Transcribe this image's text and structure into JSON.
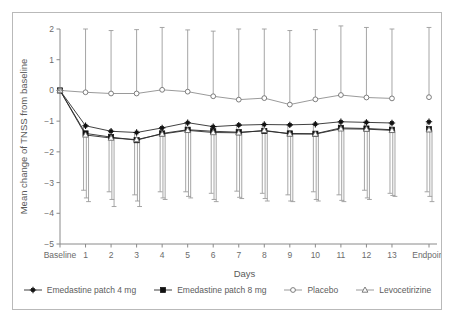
{
  "chart_data": {
    "type": "line",
    "title": "",
    "xlabel": "Days",
    "ylabel": "Mean change of TNSS from baseline",
    "ylim": [
      -5,
      2
    ],
    "yticks": [
      2,
      1,
      0,
      -1,
      -2,
      -3,
      -4,
      -5
    ],
    "ytick_labels": [
      "2",
      "1",
      "0",
      "−1",
      "−2",
      "−3",
      "−4",
      "−5"
    ],
    "grid": false,
    "legend_position": "bottom",
    "categories": [
      "Baseline",
      "1",
      "2",
      "3",
      "4",
      "5",
      "6",
      "7",
      "8",
      "9",
      "10",
      "11",
      "12",
      "13",
      "Endpoint"
    ],
    "gap_before_last": true,
    "series": [
      {
        "name": "Emedastine patch 4 mg",
        "marker": "cross-diamond",
        "marker_fill": "filled",
        "values": [
          0.0,
          -1.15,
          -1.33,
          -1.37,
          -1.22,
          -1.05,
          -1.18,
          -1.13,
          -1.11,
          -1.12,
          -1.1,
          -1.02,
          -1.04,
          -1.06,
          -1.02
        ],
        "err_low": [
          0.0,
          -3.25,
          -3.3,
          -3.4,
          -3.3,
          -3.3,
          -3.35,
          -3.28,
          -3.35,
          -3.4,
          -3.3,
          -3.4,
          -3.25,
          -3.35,
          -3.3
        ],
        "err_high": [
          0.0,
          -1.15,
          -1.33,
          -1.37,
          -1.22,
          -1.05,
          -1.18,
          -1.13,
          -1.11,
          -1.12,
          -1.1,
          -1.02,
          -1.04,
          -1.06,
          -1.02
        ]
      },
      {
        "name": "Emedastine patch 8 mg",
        "marker": "square",
        "marker_fill": "filled",
        "values": [
          0.0,
          -1.4,
          -1.52,
          -1.62,
          -1.4,
          -1.28,
          -1.33,
          -1.36,
          -1.32,
          -1.4,
          -1.41,
          -1.22,
          -1.24,
          -1.28,
          -1.26
        ],
        "err_low": [
          0.0,
          -3.5,
          -3.55,
          -3.6,
          -3.5,
          -3.45,
          -3.55,
          -3.48,
          -3.52,
          -3.6,
          -3.55,
          -3.58,
          -3.5,
          -3.42,
          -3.45
        ],
        "err_high": [
          0.0,
          -1.4,
          -1.52,
          -1.62,
          -1.4,
          -1.28,
          -1.33,
          -1.36,
          -1.32,
          -1.4,
          -1.41,
          -1.22,
          -1.24,
          -1.28,
          -1.26
        ]
      },
      {
        "name": "Placebo",
        "marker": "circle",
        "marker_fill": "open",
        "values": [
          0.0,
          -0.06,
          -0.1,
          -0.1,
          0.02,
          -0.04,
          -0.19,
          -0.3,
          -0.25,
          -0.46,
          -0.29,
          -0.15,
          -0.23,
          -0.26,
          -0.22
        ],
        "err_low": [
          0.0,
          -0.06,
          -0.1,
          -0.1,
          0.02,
          -0.04,
          -0.19,
          -0.3,
          -0.25,
          -0.46,
          -0.29,
          -0.15,
          -0.23,
          -0.26,
          -0.22
        ],
        "err_high": [
          0.0,
          2.0,
          1.95,
          1.98,
          2.05,
          1.97,
          1.93,
          2.0,
          2.0,
          1.95,
          1.98,
          2.1,
          2.05,
          2.0,
          2.05
        ]
      },
      {
        "name": "Levocetirizine",
        "marker": "triangle",
        "marker_fill": "open",
        "values": [
          0.0,
          -1.45,
          -1.55,
          -1.6,
          -1.42,
          -1.3,
          -1.37,
          -1.38,
          -1.3,
          -1.42,
          -1.42,
          -1.25,
          -1.26,
          -1.3,
          -1.28
        ],
        "err_low": [
          0.0,
          -3.62,
          -3.78,
          -3.78,
          -3.55,
          -3.5,
          -3.62,
          -3.52,
          -3.6,
          -3.62,
          -3.6,
          -3.62,
          -3.55,
          -3.45,
          -3.62
        ],
        "err_high": [
          0.0,
          -1.45,
          -1.55,
          -1.6,
          -1.42,
          -1.3,
          -1.37,
          -1.38,
          -1.3,
          -1.42,
          -1.42,
          -1.25,
          -1.26,
          -1.3,
          -1.28
        ]
      }
    ]
  },
  "legend": {
    "items": [
      {
        "label": "Emedastine patch 4 mg",
        "marker": "cross-diamond"
      },
      {
        "label": "Emedastine patch 8 mg",
        "marker": "square"
      },
      {
        "label": "Placebo",
        "marker": "circle"
      },
      {
        "label": "Levocetirizine",
        "marker": "triangle"
      }
    ]
  }
}
